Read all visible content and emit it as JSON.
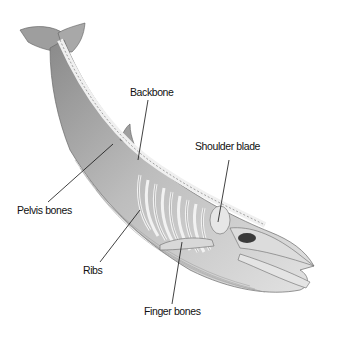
{
  "diagram": {
    "colors": {
      "background": "#ffffff",
      "skin_light": "#d9d9d9",
      "skin_mid": "#b3b3b3",
      "skin_dark": "#7d7d7d",
      "bone": "#eeeeee",
      "bone_outline": "#6a6a6a",
      "leader_line": "#111111",
      "label_text": "#111111"
    },
    "labels": [
      {
        "id": "backbone",
        "text": "Backbone",
        "x": 130,
        "y": 86
      },
      {
        "id": "shoulder-blade",
        "text": "Shoulder blade",
        "x": 195,
        "y": 140
      },
      {
        "id": "pelvis-bones",
        "text": "Pelvis bones",
        "x": 17,
        "y": 204
      },
      {
        "id": "ribs",
        "text": "Ribs",
        "x": 83,
        "y": 264
      },
      {
        "id": "finger-bones",
        "text": "Finger bones",
        "x": 144,
        "y": 305
      }
    ]
  }
}
